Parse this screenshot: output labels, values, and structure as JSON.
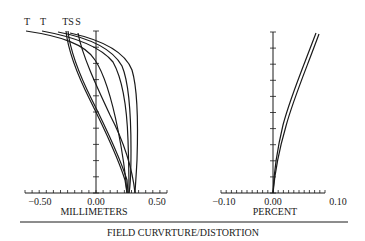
{
  "figure": {
    "title": "FIELD CURVRTURE/DISTORTION"
  },
  "chart_data": [
    {
      "type": "line",
      "title": "Field Curvature",
      "xlabel": "MILLIMETERS",
      "ylabel": "",
      "xlim": [
        -0.5,
        0.5
      ],
      "ylim": [
        0,
        1
      ],
      "xticks": [
        "-0.50",
        "0.00",
        "0.50"
      ],
      "grid": false,
      "curve_labels": [
        "T",
        "T",
        "TS",
        "S"
      ],
      "series": [
        {
          "name": "T (1)",
          "y": [
            0,
            0.2,
            0.4,
            0.6,
            0.8,
            1.0
          ],
          "x": [
            0.22,
            0.2,
            0.12,
            0.02,
            -0.18,
            -0.52
          ]
        },
        {
          "name": "T (2)",
          "y": [
            0,
            0.2,
            0.4,
            0.6,
            0.8,
            1.0
          ],
          "x": [
            0.24,
            0.25,
            0.23,
            0.18,
            0.05,
            -0.33
          ]
        },
        {
          "name": "T (3)",
          "y": [
            0,
            0.2,
            0.4,
            0.6,
            0.8,
            1.0
          ],
          "x": [
            0.23,
            0.26,
            0.28,
            0.24,
            0.1,
            -0.2
          ]
        },
        {
          "name": "S (1)",
          "y": [
            0,
            0.2,
            0.4,
            0.6,
            0.8,
            1.0
          ],
          "x": [
            0.23,
            0.18,
            0.07,
            -0.05,
            -0.15,
            -0.25
          ]
        },
        {
          "name": "S (2)",
          "y": [
            0,
            0.2,
            0.4,
            0.6,
            0.8,
            1.0
          ],
          "x": [
            0.32,
            0.33,
            0.33,
            0.3,
            0.18,
            -0.08
          ]
        },
        {
          "name": "S (3)",
          "y": [
            0,
            0.2,
            0.4,
            0.6,
            0.8,
            1.0
          ],
          "x": [
            0.32,
            0.26,
            0.12,
            -0.02,
            -0.12,
            -0.2
          ]
        }
      ]
    },
    {
      "type": "line",
      "title": "Distortion",
      "xlabel": "PERCENT",
      "ylabel": "",
      "xlim": [
        -0.1,
        0.1
      ],
      "ylim": [
        0,
        1
      ],
      "xticks": [
        "-0.10",
        "0.00",
        "0.10"
      ],
      "grid": false,
      "series": [
        {
          "name": "Distortion (1)",
          "y": [
            0,
            0.2,
            0.4,
            0.6,
            0.8,
            1.0
          ],
          "x": [
            0.0,
            0.004,
            0.012,
            0.025,
            0.045,
            0.068
          ]
        },
        {
          "name": "Distortion (2)",
          "y": [
            0,
            0.2,
            0.4,
            0.6,
            0.8,
            1.0
          ],
          "x": [
            0.0,
            0.006,
            0.016,
            0.03,
            0.05,
            0.072
          ]
        }
      ]
    }
  ],
  "left": {
    "xlabel": "MILLIMETERS",
    "ticks": [
      "−0.50",
      "0.00",
      "0.50"
    ],
    "curve_labels": [
      "T",
      "T",
      "TS",
      "S"
    ]
  },
  "right": {
    "xlabel": "PERCENT",
    "ticks": [
      "−0.10",
      "0.00",
      "0.10"
    ]
  }
}
